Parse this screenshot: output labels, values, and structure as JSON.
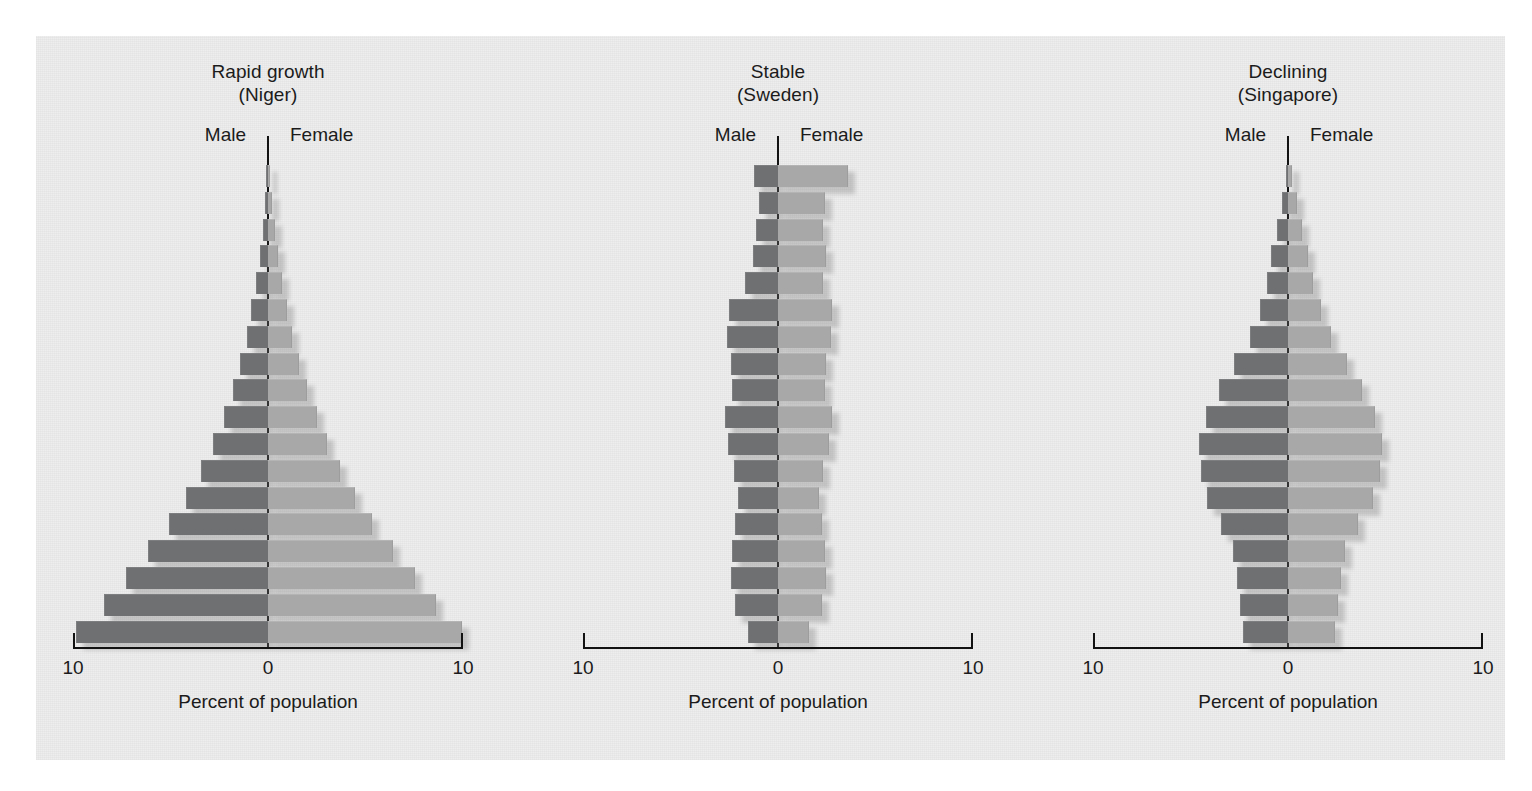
{
  "figure": {
    "background": "#eeeeee",
    "male_color": "#6e7072",
    "female_color": "#a8a8a8",
    "axis_color": "#121212"
  },
  "panels": [
    {
      "title_line1": "Rapid growth",
      "title_line2": "(Niger)",
      "male_label": "Male",
      "female_label": "Female",
      "axis_left_label": "10",
      "axis_center_label": "0",
      "axis_right_label": "10",
      "caption": "Percent of population"
    },
    {
      "title_line1": "Stable",
      "title_line2": "(Sweden)",
      "male_label": "Male",
      "female_label": "Female",
      "axis_left_label": "10",
      "axis_center_label": "0",
      "axis_right_label": "10",
      "caption": "Percent of population"
    },
    {
      "title_line1": "Declining",
      "title_line2": "(Singapore)",
      "male_label": "Male",
      "female_label": "Female",
      "axis_left_label": "10",
      "axis_center_label": "0",
      "axis_right_label": "10",
      "caption": "Percent of population"
    }
  ],
  "chart_data": [
    {
      "type": "bar",
      "subtype": "population-pyramid",
      "title": "Rapid growth (Niger)",
      "xlabel": "Percent of population",
      "ylabel": "",
      "xlim": [
        -10,
        10
      ],
      "xticks": [
        10,
        0,
        10
      ],
      "grid": false,
      "legend": [
        "Male",
        "Female"
      ],
      "legend_position": "above-axis",
      "categories": [
        "85+",
        "80-84",
        "75-79",
        "70-74",
        "65-69",
        "60-64",
        "55-59",
        "50-54",
        "45-49",
        "40-44",
        "35-39",
        "30-34",
        "25-29",
        "20-24",
        "15-19",
        "10-14",
        "5-9",
        "0-4"
      ],
      "series": [
        {
          "name": "Male",
          "values": [
            0.1,
            0.18,
            0.28,
            0.42,
            0.62,
            0.85,
            1.1,
            1.42,
            1.8,
            2.25,
            2.8,
            3.45,
            4.2,
            5.1,
            6.15,
            7.3,
            8.4,
            9.85
          ]
        },
        {
          "name": "Female",
          "values": [
            0.12,
            0.22,
            0.34,
            0.5,
            0.72,
            0.98,
            1.25,
            1.6,
            2.0,
            2.5,
            3.05,
            3.7,
            4.45,
            5.35,
            6.4,
            7.55,
            8.6,
            9.95
          ]
        }
      ]
    },
    {
      "type": "bar",
      "subtype": "population-pyramid",
      "title": "Stable (Sweden)",
      "xlabel": "Percent of population",
      "ylabel": "",
      "xlim": [
        -10,
        10
      ],
      "xticks": [
        10,
        0,
        10
      ],
      "grid": false,
      "legend": [
        "Male",
        "Female"
      ],
      "legend_position": "above-axis",
      "categories": [
        "85+",
        "80-84",
        "75-79",
        "70-74",
        "65-69",
        "60-64",
        "55-59",
        "50-54",
        "45-49",
        "40-44",
        "35-39",
        "30-34",
        "25-29",
        "20-24",
        "15-19",
        "10-14",
        "5-9",
        "0-4"
      ],
      "series": [
        {
          "name": "Male",
          "values": [
            1.25,
            1.0,
            1.15,
            1.3,
            1.7,
            2.5,
            2.6,
            2.4,
            2.35,
            2.7,
            2.55,
            2.25,
            2.05,
            2.2,
            2.35,
            2.4,
            2.2,
            1.55
          ]
        },
        {
          "name": "Female",
          "values": [
            3.6,
            2.4,
            2.3,
            2.45,
            2.3,
            2.75,
            2.7,
            2.45,
            2.4,
            2.75,
            2.6,
            2.3,
            2.1,
            2.25,
            2.4,
            2.45,
            2.25,
            1.6
          ]
        }
      ]
    },
    {
      "type": "bar",
      "subtype": "population-pyramid",
      "title": "Declining (Singapore)",
      "xlabel": "Percent of population",
      "ylabel": "",
      "xlim": [
        -10,
        10
      ],
      "xticks": [
        10,
        0,
        10
      ],
      "grid": false,
      "legend": [
        "Male",
        "Female"
      ],
      "legend_position": "above-axis",
      "categories": [
        "85+",
        "80-84",
        "75-79",
        "70-74",
        "65-69",
        "60-64",
        "55-59",
        "50-54",
        "45-49",
        "40-44",
        "35-39",
        "30-34",
        "25-29",
        "20-24",
        "15-19",
        "10-14",
        "5-9",
        "0-4"
      ],
      "series": [
        {
          "name": "Male",
          "values": [
            0.12,
            0.3,
            0.55,
            0.85,
            1.1,
            1.45,
            1.95,
            2.75,
            3.55,
            4.2,
            4.55,
            4.45,
            4.15,
            3.45,
            2.8,
            2.6,
            2.45,
            2.3
          ]
        },
        {
          "name": "Female",
          "values": [
            0.2,
            0.45,
            0.7,
            1.0,
            1.3,
            1.7,
            2.2,
            3.0,
            3.8,
            4.45,
            4.8,
            4.7,
            4.35,
            3.6,
            2.9,
            2.7,
            2.55,
            2.4
          ]
        }
      ]
    }
  ]
}
